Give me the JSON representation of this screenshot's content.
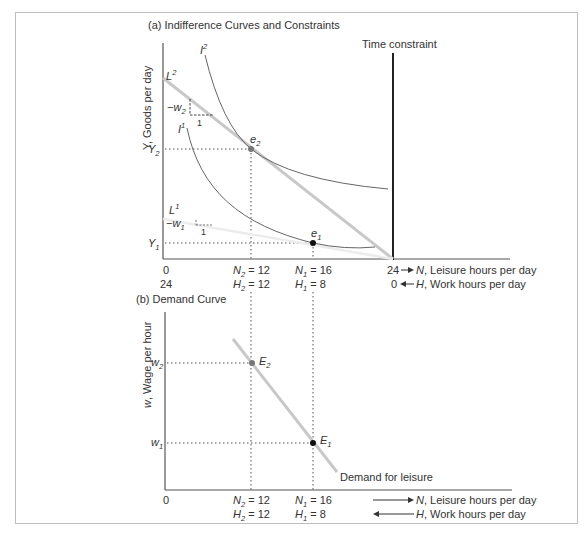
{
  "panel_a": {
    "title": "(a) Indifference Curves and Constraints",
    "y_axis_label": "Y, Goods per day",
    "time_constraint_label": "Time constraint",
    "curves": {
      "I2": {
        "label": "I",
        "sup": "2"
      },
      "I1": {
        "label": "I",
        "sup": "1"
      },
      "L2": {
        "label": "L",
        "sup": "2"
      },
      "L1": {
        "label": "L",
        "sup": "1"
      }
    },
    "slope_labels": {
      "w2": {
        "text": "−w",
        "sub": "2",
        "run": "1"
      },
      "w1": {
        "text": "−w",
        "sub": "1",
        "run": "1"
      }
    },
    "points": {
      "e2": {
        "label": "e",
        "sub": "2"
      },
      "e1": {
        "label": "e",
        "sub": "1"
      }
    },
    "y_ticks": {
      "Y2": {
        "label": "Y",
        "sub": "2"
      },
      "Y1": {
        "label": "Y",
        "sub": "1"
      }
    },
    "x_ticks_N": [
      {
        "pre": "0",
        "sub": "",
        "post": ""
      },
      {
        "pre": "N",
        "sub": "2",
        "post": " = 12"
      },
      {
        "pre": "N",
        "sub": "1",
        "post": " = 16"
      }
    ],
    "x_ticks_H": [
      {
        "pre": "24",
        "sub": "",
        "post": ""
      },
      {
        "pre": "H",
        "sub": "2",
        "post": " = 12"
      },
      {
        "pre": "H",
        "sub": "1",
        "post": " = 8"
      }
    ],
    "x_axis_N": {
      "value": "24",
      "var": "N",
      "label": ", Leisure hours per day"
    },
    "x_axis_H": {
      "value": "0",
      "var": "H",
      "label": ", Work hours per day"
    }
  },
  "panel_b": {
    "title": "(b) Demand Curve",
    "y_axis_label": "w, Wage per hour",
    "y_ticks": {
      "w2": {
        "label": "w",
        "sub": "2"
      },
      "w1": {
        "label": "w",
        "sub": "1"
      }
    },
    "points": {
      "E2": {
        "label": "E",
        "sub": "2"
      },
      "E1": {
        "label": "E",
        "sub": "1"
      }
    },
    "demand_label": "Demand for leisure",
    "x_ticks_N": [
      {
        "pre": "0",
        "sub": "",
        "post": ""
      },
      {
        "pre": "N",
        "sub": "2",
        "post": " = 12"
      },
      {
        "pre": "N",
        "sub": "1",
        "post": " = 16"
      }
    ],
    "x_ticks_H": [
      {
        "pre": "H",
        "sub": "2",
        "post": " = 12"
      },
      {
        "pre": "H",
        "sub": "1",
        "post": " = 8"
      }
    ],
    "x_axis_N": {
      "var": "N",
      "label": ", Leisure hours per day"
    },
    "x_axis_H": {
      "var": "H",
      "label": ", Work hours per day"
    }
  },
  "colors": {
    "axis": "#555555",
    "curve": "#666666",
    "budget_line": "#c8c8c8",
    "budget_line_faint": "#ececec",
    "time_constraint": "#222222",
    "point_e1": "#111111",
    "point_e2": "#777777",
    "frame": "#bdbdbd"
  }
}
